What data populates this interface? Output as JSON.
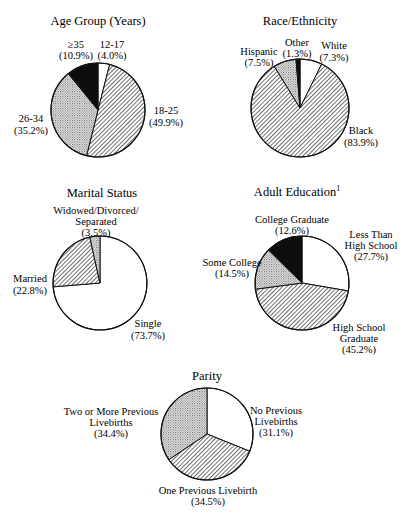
{
  "chart_data": [
    {
      "type": "pie",
      "title": "Age Group (Years)",
      "center": [
        98,
        110
      ],
      "radius": 47,
      "slices": [
        {
          "label": "12-17",
          "pct_label": "(4.0%)",
          "value": 4.0,
          "fill": "white"
        },
        {
          "label": "18-25",
          "pct_label": "(49.9%)",
          "value": 49.9,
          "fill": "hatch"
        },
        {
          "label": "26-34",
          "pct_label": "(35.2%)",
          "value": 35.2,
          "fill": "dots"
        },
        {
          "label": "≥35",
          "pct_label": "(10.9%)",
          "value": 10.9,
          "fill": "black"
        }
      ]
    },
    {
      "type": "pie",
      "title": "Race/Ethnicity",
      "center": [
        300,
        108
      ],
      "radius": 49,
      "slices": [
        {
          "label": "White",
          "pct_label": "(7.3%)",
          "value": 7.3,
          "fill": "white"
        },
        {
          "label": "Black",
          "pct_label": "(83.9%)",
          "value": 83.9,
          "fill": "hatch"
        },
        {
          "label": "Hispanic",
          "pct_label": "(7.5%)",
          "value": 7.5,
          "fill": "dots"
        },
        {
          "label": "Other",
          "pct_label": "(1.3%)",
          "value": 1.3,
          "fill": "black"
        }
      ]
    },
    {
      "type": "pie",
      "title": "Marital Status",
      "center": [
        100,
        283
      ],
      "radius": 47,
      "slices": [
        {
          "label": "Single",
          "pct_label": "(73.7%)",
          "value": 73.7,
          "fill": "white"
        },
        {
          "label": "Married",
          "pct_label": "(22.8%)",
          "value": 22.8,
          "fill": "hatch"
        },
        {
          "label": "Widowed/Divorced/ Separated",
          "pct_label": "(3.5%)",
          "value": 3.5,
          "fill": "dots"
        }
      ]
    },
    {
      "type": "pie",
      "title": "Adult Education",
      "title_superscript": "1",
      "center": [
        302,
        283
      ],
      "radius": 47,
      "slices": [
        {
          "label": "Less Than High School",
          "pct_label": "(27.7%)",
          "value": 27.7,
          "fill": "white"
        },
        {
          "label": "High School Graduate",
          "pct_label": "(45.2%)",
          "value": 45.2,
          "fill": "hatch"
        },
        {
          "label": "Some College",
          "pct_label": "(14.5%)",
          "value": 14.5,
          "fill": "dots"
        },
        {
          "label": "College Graduate",
          "pct_label": "(12.6%)",
          "value": 12.6,
          "fill": "black"
        }
      ]
    },
    {
      "type": "pie",
      "title": "Parity",
      "center": [
        207,
        434
      ],
      "radius": 46,
      "slices": [
        {
          "label": "No Previous Livebirths",
          "pct_label": "(31.1%)",
          "value": 31.1,
          "fill": "white"
        },
        {
          "label": "One Previous Livebirth",
          "pct_label": "(34.5%)",
          "value": 34.5,
          "fill": "hatch"
        },
        {
          "label": "Two or More Previous Livebirths",
          "pct_label": "(34.4%)",
          "value": 34.4,
          "fill": "dots"
        }
      ]
    }
  ],
  "charts": {
    "age": {
      "title": "Age Group (Years)",
      "l1a": "12-17",
      "l1b": "(4.0%)",
      "l2a": "18-25",
      "l2b": "(49.9%)",
      "l3a": "26-34",
      "l3b": "(35.2%)",
      "l4a": "≥35",
      "l4b": "(10.9%)"
    },
    "race": {
      "title": "Race/Ethnicity",
      "l1a": "White",
      "l1b": "(7.3%)",
      "l2a": "Black",
      "l2b": "(83.9%)",
      "l3a": "Hispanic",
      "l3b": "(7.5%)",
      "l4a": "Other",
      "l4b": "(1.3%)"
    },
    "marital": {
      "title": "Marital Status",
      "l1a": "Single",
      "l1b": "(73.7%)",
      "l2a": "Married",
      "l2b": "(22.8%)",
      "l3a": "Widowed/Divorced/",
      "l3b": "Separated",
      "l3c": "(3.5%)"
    },
    "education": {
      "title": "Adult Education",
      "sup": "1",
      "l1a": "Less Than",
      "l1b": "High School",
      "l1c": "(27.7%)",
      "l2a": "High School",
      "l2b": "Graduate",
      "l2c": "(45.2%)",
      "l3a": "Some College",
      "l3b": "(14.5%)",
      "l4a": "College Graduate",
      "l4b": "(12.6%)"
    },
    "parity": {
      "title": "Parity",
      "l1a": "No Previous",
      "l1b": "Livebirths",
      "l1c": "(31.1%)",
      "l2a": "One Previous Livebirth",
      "l2b": "(34.5%)",
      "l3a": "Two or More Previous",
      "l3b": "Livebirths",
      "l3c": "(34.4%)"
    }
  }
}
